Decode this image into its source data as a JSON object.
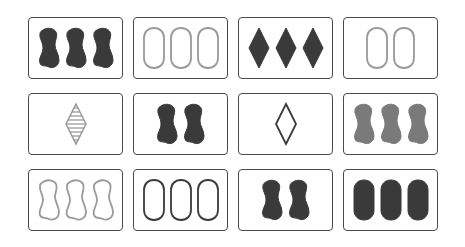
{
  "game": "set",
  "palette": {
    "dark": "#3a3a3a",
    "medium": "#7a7a7a",
    "light": "#9a9a9a"
  },
  "cards": [
    {
      "row": 0,
      "col": 0,
      "shape": "squiggle",
      "color": "dark",
      "fill": "solid",
      "count": 3
    },
    {
      "row": 0,
      "col": 1,
      "shape": "oval",
      "color": "light",
      "fill": "outline",
      "count": 3
    },
    {
      "row": 0,
      "col": 2,
      "shape": "diamond",
      "color": "dark",
      "fill": "solid",
      "count": 3
    },
    {
      "row": 0,
      "col": 3,
      "shape": "oval",
      "color": "light",
      "fill": "outline",
      "count": 2
    },
    {
      "row": 1,
      "col": 0,
      "shape": "diamond",
      "color": "light",
      "fill": "striped",
      "count": 1
    },
    {
      "row": 1,
      "col": 1,
      "shape": "squiggle",
      "color": "dark",
      "fill": "solid",
      "count": 2
    },
    {
      "row": 1,
      "col": 2,
      "shape": "diamond",
      "color": "dark",
      "fill": "outline",
      "count": 1
    },
    {
      "row": 1,
      "col": 3,
      "shape": "squiggle",
      "color": "medium",
      "fill": "solid",
      "count": 3
    },
    {
      "row": 2,
      "col": 0,
      "shape": "squiggle",
      "color": "light",
      "fill": "outline",
      "count": 3
    },
    {
      "row": 2,
      "col": 1,
      "shape": "oval",
      "color": "dark",
      "fill": "outline",
      "count": 3
    },
    {
      "row": 2,
      "col": 2,
      "shape": "squiggle",
      "color": "dark",
      "fill": "solid",
      "count": 2
    },
    {
      "row": 2,
      "col": 3,
      "shape": "oval",
      "color": "dark",
      "fill": "solid",
      "count": 3
    }
  ]
}
